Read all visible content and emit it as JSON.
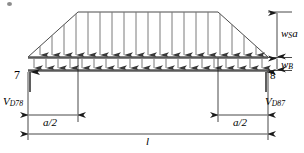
{
  "figure": {
    "type": "structural-load-diagram"
  },
  "labels": {
    "load_top": {
      "main": "w",
      "sub": "S",
      "suffix": "a"
    },
    "load_bottom": {
      "main": "w",
      "sub": "B",
      "suffix": ""
    },
    "reaction_left": {
      "main": "V",
      "sub": "D78"
    },
    "reaction_right": {
      "main": "V",
      "sub": "D87"
    },
    "node_left": "7",
    "node_right": "8",
    "dim_left": "a/2",
    "dim_right": "a/2",
    "dim_span": "l"
  },
  "geometry": {
    "beam_left_x": 28,
    "beam_right_x": 268,
    "beam_top_y": 57,
    "beam_bottom_y": 70,
    "plateau_top_y": 12,
    "ramp_left_end_x": 78,
    "ramp_right_start_x": 218,
    "arrow_count_top": 20,
    "arrow_count_bottom": 20,
    "dim_a_half_left": [
      28,
      78
    ],
    "dim_a_half_right": [
      218,
      268
    ],
    "dim_span_full": [
      28,
      268
    ]
  },
  "colors": {
    "line": "#1a1a1a",
    "arrow": "#3a3a3a",
    "beam": "#555555",
    "dimension": "#1a1a1a",
    "background": "#ffffff"
  }
}
